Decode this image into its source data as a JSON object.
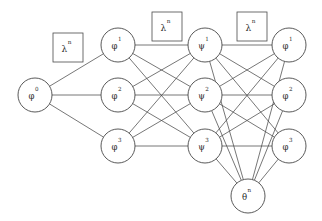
{
  "diagram": {
    "type": "neural-network-graph",
    "title": "",
    "canvas": {
      "width": 322,
      "height": 221,
      "background": "#ffffff"
    },
    "style": {
      "edge_color": "#4a4a4a",
      "node_stroke_color": "#3c3c3c",
      "node_fill_color": "#ffffff",
      "text_color": "#2b2b2b",
      "node_radius": 17,
      "edge_width": 0.75
    },
    "layers": [
      {
        "id": "layer-0",
        "name": "input-layer",
        "x": 35,
        "nodes": [
          {
            "id": "n-phi0",
            "base": "φ",
            "sup": "0",
            "cx": 35,
            "cy": 95,
            "r": 17
          }
        ]
      },
      {
        "id": "layer-1",
        "name": "hidden-layer-phi",
        "x": 118,
        "nodes": [
          {
            "id": "n-phi1-a",
            "base": "φ",
            "sup": "1",
            "cx": 118,
            "cy": 45,
            "r": 17
          },
          {
            "id": "n-phi2-a",
            "base": "φ",
            "sup": "2",
            "cx": 118,
            "cy": 95,
            "r": 17
          },
          {
            "id": "n-phi3-a",
            "base": "φ",
            "sup": "3",
            "cx": 118,
            "cy": 146,
            "r": 17
          }
        ]
      },
      {
        "id": "layer-2",
        "name": "hidden-layer-psi",
        "x": 205,
        "nodes": [
          {
            "id": "n-psi1",
            "base": "ψ",
            "sup": "1",
            "cx": 205,
            "cy": 45,
            "r": 17
          },
          {
            "id": "n-psi2",
            "base": "ψ",
            "sup": "2",
            "cx": 205,
            "cy": 95,
            "r": 17
          },
          {
            "id": "n-psi3",
            "base": "ψ",
            "sup": "3",
            "cx": 205,
            "cy": 146,
            "r": 17
          }
        ]
      },
      {
        "id": "layer-3",
        "name": "output-layer-phi",
        "x": 289,
        "nodes": [
          {
            "id": "n-phi1-b",
            "base": "φ",
            "sup": "1",
            "cx": 289,
            "cy": 45,
            "r": 17
          },
          {
            "id": "n-phi2-b",
            "base": "φ",
            "sup": "2",
            "cx": 289,
            "cy": 95,
            "r": 17
          },
          {
            "id": "n-phi3-b",
            "base": "φ",
            "sup": "3",
            "cx": 289,
            "cy": 146,
            "r": 17
          }
        ]
      },
      {
        "id": "layer-4",
        "name": "theta-node-layer",
        "x": 248,
        "nodes": [
          {
            "id": "n-theta",
            "base": "θ",
            "sup": "n",
            "cx": 248,
            "cy": 196,
            "r": 17
          }
        ]
      }
    ],
    "param_boxes": [
      {
        "id": "box-lambda-1",
        "base": "λ",
        "sup": "n",
        "x": 53,
        "y": 33,
        "w": 30,
        "h": 29
      },
      {
        "id": "box-lambda-2",
        "base": "λ",
        "sup": "n",
        "x": 152,
        "y": 12,
        "w": 30,
        "h": 29
      },
      {
        "id": "box-lambda-3",
        "base": "λ",
        "sup": "n",
        "x": 237,
        "y": 12,
        "w": 30,
        "h": 29
      }
    ],
    "edges": [
      {
        "from": "n-phi0",
        "to": "n-phi1-a"
      },
      {
        "from": "n-phi0",
        "to": "n-phi2-a"
      },
      {
        "from": "n-phi0",
        "to": "n-phi3-a"
      },
      {
        "from": "n-phi1-a",
        "to": "n-psi1"
      },
      {
        "from": "n-phi1-a",
        "to": "n-psi2"
      },
      {
        "from": "n-phi1-a",
        "to": "n-psi3"
      },
      {
        "from": "n-phi2-a",
        "to": "n-psi1"
      },
      {
        "from": "n-phi2-a",
        "to": "n-psi2"
      },
      {
        "from": "n-phi2-a",
        "to": "n-psi3"
      },
      {
        "from": "n-phi3-a",
        "to": "n-psi1"
      },
      {
        "from": "n-phi3-a",
        "to": "n-psi2"
      },
      {
        "from": "n-phi3-a",
        "to": "n-psi3"
      },
      {
        "from": "n-psi1",
        "to": "n-phi1-b"
      },
      {
        "from": "n-psi1",
        "to": "n-phi2-b"
      },
      {
        "from": "n-psi1",
        "to": "n-phi3-b"
      },
      {
        "from": "n-psi2",
        "to": "n-phi1-b"
      },
      {
        "from": "n-psi2",
        "to": "n-phi2-b"
      },
      {
        "from": "n-psi2",
        "to": "n-phi3-b"
      },
      {
        "from": "n-psi3",
        "to": "n-phi1-b"
      },
      {
        "from": "n-psi3",
        "to": "n-phi2-b"
      },
      {
        "from": "n-psi3",
        "to": "n-phi3-b"
      },
      {
        "from": "n-psi1",
        "to": "n-theta"
      },
      {
        "from": "n-psi2",
        "to": "n-theta"
      },
      {
        "from": "n-psi3",
        "to": "n-theta"
      },
      {
        "from": "n-phi1-b",
        "to": "n-theta"
      },
      {
        "from": "n-phi2-b",
        "to": "n-theta"
      },
      {
        "from": "n-phi3-b",
        "to": "n-theta"
      }
    ]
  }
}
